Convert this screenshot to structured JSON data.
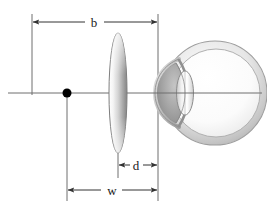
{
  "figure": {
    "type": "optical-schematic-diagram",
    "background_color": "#ffffff",
    "line_color": "#555555",
    "label_color": "#1a1a1a"
  },
  "labels": {
    "b": "b",
    "d": "d",
    "w": "w"
  },
  "dimensions": [
    {
      "key": "b",
      "label": "b",
      "description": "distance from far reference plane to corneal vertex plane",
      "from_x": 32,
      "to_x": 158,
      "y": 22
    },
    {
      "key": "d",
      "label": "d",
      "description": "vertex distance from spectacle lens plane to corneal vertex plane",
      "from_x": 118,
      "to_x": 158,
      "y": 165
    },
    {
      "key": "w",
      "label": "w",
      "description": "distance from object point to corneal vertex plane",
      "from_x": 67,
      "to_x": 158,
      "y": 190
    }
  ],
  "elements": {
    "optical_axis": {
      "name": "optical-axis",
      "y": 93,
      "from_x": 8,
      "to_x": 262
    },
    "object_point": {
      "name": "object-point",
      "x": 67,
      "y": 93,
      "radius": 4.5,
      "color": "#000000"
    },
    "spectacle_lens": {
      "name": "spectacle-lens",
      "center_x": 118,
      "center_y": 93,
      "half_width": 9,
      "half_height": 60,
      "fill_light": "#ffffff",
      "fill_dark": "#8d8d8d"
    },
    "eye": {
      "name": "eye-globe",
      "center_x": 215,
      "center_y": 93,
      "radius": 52,
      "sclera_color": "#c9c9c9",
      "interior_color": "#fdfdfd",
      "cornea_color": "#9a9a9a",
      "crystalline_lens_color": "#e8e8e8"
    },
    "reference_lines": [
      {
        "name": "left-reference-line",
        "x": 32,
        "from_y": 14,
        "to_y": 93
      },
      {
        "name": "object-reference-line",
        "x": 67,
        "from_y": 93,
        "to_y": 200
      },
      {
        "name": "lens-reference-line",
        "x": 118,
        "from_y": 140,
        "to_y": 180
      },
      {
        "name": "corneal-vertex-reference-line",
        "x": 158,
        "from_y": 14,
        "to_y": 200
      }
    ]
  }
}
